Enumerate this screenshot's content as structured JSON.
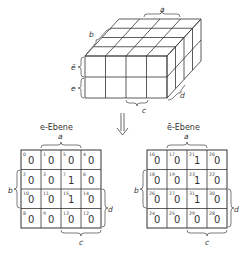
{
  "cube": {
    "labels": {
      "a": "a",
      "b": "b",
      "e_bar": "ē",
      "e": "e",
      "c": "c",
      "d": "d"
    }
  },
  "arrow": {
    "glyph": "⇓"
  },
  "maps": [
    {
      "title": "e-Ebene",
      "labels": {
        "a": "a",
        "b": "b",
        "c": "c",
        "d": "d"
      },
      "cells": [
        [
          {
            "index": "0",
            "value": "0"
          },
          {
            "index": "1",
            "value": "0"
          },
          {
            "index": "5",
            "value": "0"
          },
          {
            "index": "4",
            "value": "0"
          }
        ],
        [
          {
            "index": "2",
            "value": "0"
          },
          {
            "index": "3",
            "value": "0"
          },
          {
            "index": "7",
            "value": "1"
          },
          {
            "index": "6",
            "value": "0"
          }
        ],
        [
          {
            "index": "10",
            "value": "0"
          },
          {
            "index": "11",
            "value": "0"
          },
          {
            "index": "15",
            "value": "1"
          },
          {
            "index": "14",
            "value": "0"
          }
        ],
        [
          {
            "index": "8",
            "value": "0"
          },
          {
            "index": "9",
            "value": "0"
          },
          {
            "index": "13",
            "value": "0"
          },
          {
            "index": "12",
            "value": "0"
          }
        ]
      ]
    },
    {
      "title": "ē-Ebene",
      "labels": {
        "a": "a",
        "b": "b",
        "c": "c",
        "d": "d"
      },
      "cells": [
        [
          {
            "index": "16",
            "value": "0"
          },
          {
            "index": "17",
            "value": "0"
          },
          {
            "index": "21",
            "value": "1"
          },
          {
            "index": "20",
            "value": "0"
          }
        ],
        [
          {
            "index": "18",
            "value": "0"
          },
          {
            "index": "19",
            "value": "0"
          },
          {
            "index": "23",
            "value": "1"
          },
          {
            "index": "22",
            "value": "0"
          }
        ],
        [
          {
            "index": "26",
            "value": "0"
          },
          {
            "index": "27",
            "value": "0"
          },
          {
            "index": "31",
            "value": "1"
          },
          {
            "index": "30",
            "value": "0"
          }
        ],
        [
          {
            "index": "24",
            "value": "0"
          },
          {
            "index": "25",
            "value": "0"
          },
          {
            "index": "29",
            "value": "0"
          },
          {
            "index": "28",
            "value": "0"
          }
        ]
      ]
    }
  ]
}
